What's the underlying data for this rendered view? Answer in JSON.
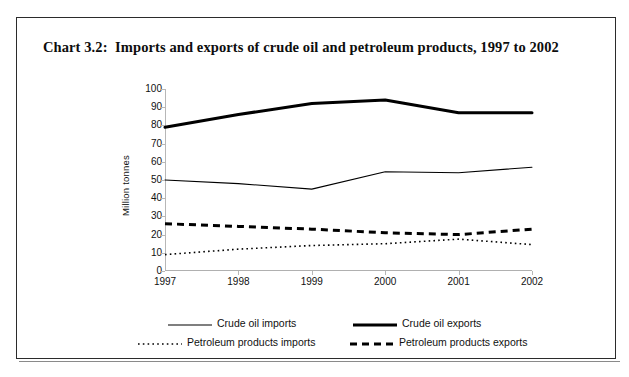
{
  "title": "Chart 3.2:  Imports and exports of crude oil and petroleum products, 1997 to 2002",
  "legend": {
    "entries": [
      {
        "label": "Crude oil imports",
        "style": "thin-solid"
      },
      {
        "label": "Crude oil exports",
        "style": "thick-solid"
      },
      {
        "label": "Petroleum products imports",
        "style": "fine-dotted"
      },
      {
        "label": "Petroleum products exports",
        "style": "thick-dashed"
      }
    ]
  },
  "chart_data": {
    "type": "line",
    "title": "Chart 3.2:  Imports and exports of crude oil and petroleum products, 1997 to 2002",
    "xlabel": "",
    "ylabel": "Million tonnes",
    "categories": [
      "1997",
      "1998",
      "1999",
      "2000",
      "2001",
      "2002"
    ],
    "ylim": [
      0,
      100
    ],
    "yticks": [
      0,
      10,
      20,
      30,
      40,
      50,
      60,
      70,
      80,
      90,
      100
    ],
    "grid": false,
    "legend_position": "bottom",
    "series": [
      {
        "name": "Crude oil imports",
        "style": "thin-solid",
        "color": "#000000",
        "values": [
          50,
          48,
          45,
          54.5,
          54,
          57
        ]
      },
      {
        "name": "Crude oil exports",
        "style": "thick-solid",
        "color": "#000000",
        "values": [
          79,
          86,
          92,
          94,
          87,
          87
        ]
      },
      {
        "name": "Petroleum products imports",
        "style": "fine-dotted",
        "color": "#000000",
        "values": [
          9,
          12,
          14,
          15,
          17.5,
          14.5
        ]
      },
      {
        "name": "Petroleum products exports",
        "style": "thick-dashed",
        "color": "#000000",
        "values": [
          26,
          24.5,
          23,
          21,
          20,
          23
        ]
      }
    ]
  }
}
